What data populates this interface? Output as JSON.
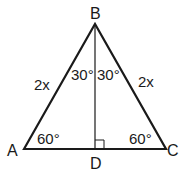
{
  "diagram": {
    "type": "triangle",
    "vertices": {
      "A": {
        "label": "A"
      },
      "B": {
        "label": "B"
      },
      "C": {
        "label": "C"
      },
      "D": {
        "label": "D"
      }
    },
    "sides": {
      "AB": {
        "label": "2x"
      },
      "BC": {
        "label": "2x"
      }
    },
    "angles": {
      "A": {
        "label": "60°"
      },
      "C": {
        "label": "60°"
      },
      "ABD": {
        "label": "30°"
      },
      "DBC": {
        "label": "30°"
      },
      "BDC": {
        "marker": "right-angle"
      }
    },
    "colors": {
      "stroke": "#1a1a1a",
      "background": "#ffffff"
    }
  }
}
